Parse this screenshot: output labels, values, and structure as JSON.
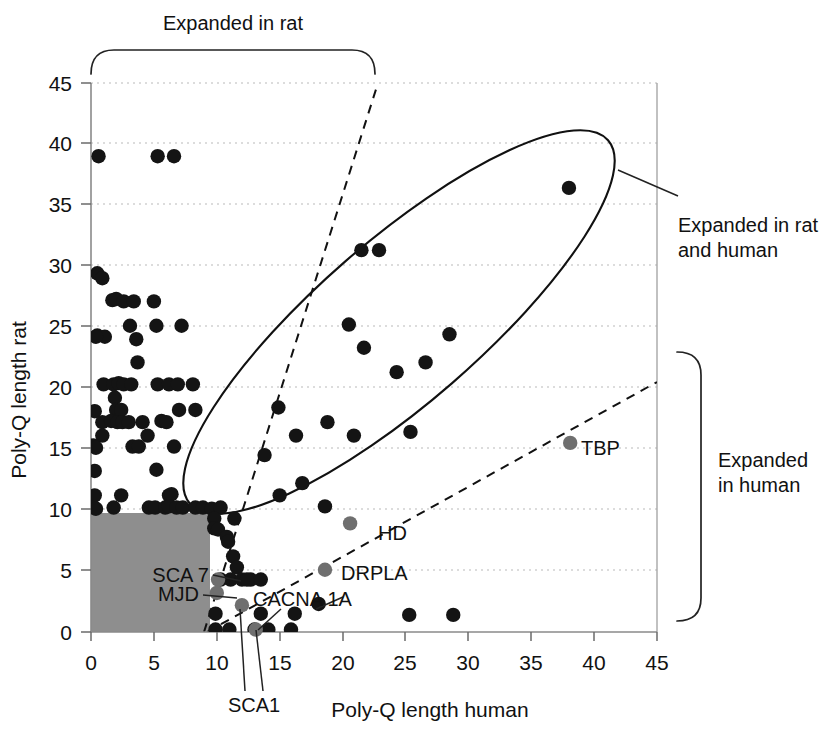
{
  "figure": {
    "background_color": "#ffffff",
    "point_color": "#141414",
    "gene_point_color": "#6f6f6f",
    "shade_color": "#8e8e8e"
  },
  "annotations": {
    "top_bracket_label": "Expanded in rat",
    "right_bracket_label_line1": "Expanded",
    "right_bracket_label_line2": "in human",
    "ellipse_label_line1": "Expanded in rat",
    "ellipse_label_line2": "and human"
  },
  "chart_data": {
    "type": "scatter",
    "title": "",
    "xlabel": "Poly-Q length human",
    "ylabel": "Poly-Q length rat",
    "xlim": [
      0,
      45
    ],
    "ylim": [
      0,
      45
    ],
    "xticks": [
      0,
      5,
      10,
      15,
      20,
      25,
      30,
      35,
      40,
      45
    ],
    "yticks": [
      0,
      5,
      10,
      15,
      20,
      25,
      30,
      35,
      40,
      45
    ],
    "xtick_labels": [
      "0",
      "5",
      "10",
      "15",
      "20",
      "25",
      "30",
      "35",
      "40",
      "45"
    ],
    "ytick_labels": [
      "0",
      "5",
      "10",
      "15",
      "20",
      "25",
      "30",
      "35",
      "40",
      "45"
    ],
    "grid": true,
    "grid_axis": "y",
    "legend": "none",
    "series": [
      {
        "name": "Poly-Q repeat pairs",
        "marker": "filled-circle",
        "color": "#141414",
        "points": [
          [
            0.6,
            39.0
          ],
          [
            5.3,
            39.0
          ],
          [
            6.6,
            39.0
          ],
          [
            0.5,
            29.4
          ],
          [
            0.9,
            29.0
          ],
          [
            1.7,
            27.2
          ],
          [
            2.0,
            27.3
          ],
          [
            2.6,
            27.1
          ],
          [
            3.4,
            27.1
          ],
          [
            5.0,
            27.1
          ],
          [
            0.5,
            24.3
          ],
          [
            1.1,
            24.2
          ],
          [
            3.1,
            25.1
          ],
          [
            5.2,
            25.1
          ],
          [
            7.2,
            25.1
          ],
          [
            3.6,
            24.0
          ],
          [
            3.7,
            22.1
          ],
          [
            0.4,
            24.2
          ],
          [
            1.0,
            20.3
          ],
          [
            1.8,
            20.3
          ],
          [
            2.2,
            20.4
          ],
          [
            2.6,
            20.3
          ],
          [
            3.2,
            20.3
          ],
          [
            5.3,
            20.3
          ],
          [
            6.2,
            20.3
          ],
          [
            6.9,
            20.3
          ],
          [
            8.1,
            20.3
          ],
          [
            1.9,
            19.2
          ],
          [
            0.3,
            18.1
          ],
          [
            2.0,
            18.2
          ],
          [
            2.4,
            18.2
          ],
          [
            7.0,
            18.2
          ],
          [
            8.3,
            18.2
          ],
          [
            0.9,
            17.2
          ],
          [
            1.6,
            17.3
          ],
          [
            2.1,
            17.2
          ],
          [
            2.5,
            17.2
          ],
          [
            3.0,
            17.2
          ],
          [
            4.1,
            17.2
          ],
          [
            5.6,
            17.3
          ],
          [
            6.0,
            17.2
          ],
          [
            0.9,
            16.1
          ],
          [
            4.5,
            16.1
          ],
          [
            0.2,
            15.3
          ],
          [
            0.4,
            15.1
          ],
          [
            3.3,
            15.2
          ],
          [
            3.8,
            15.2
          ],
          [
            6.6,
            15.2
          ],
          [
            0.3,
            13.2
          ],
          [
            5.2,
            13.3
          ],
          [
            0.3,
            11.2
          ],
          [
            2.4,
            11.2
          ],
          [
            6.2,
            11.2
          ],
          [
            6.4,
            11.3
          ],
          [
            0.2,
            10.2
          ],
          [
            0.4,
            10.1
          ],
          [
            1.8,
            10.2
          ],
          [
            4.6,
            10.2
          ],
          [
            5.1,
            10.2
          ],
          [
            5.9,
            10.2
          ],
          [
            6.2,
            10.3
          ],
          [
            6.8,
            10.2
          ],
          [
            7.3,
            10.2
          ],
          [
            8.3,
            10.2
          ],
          [
            8.9,
            10.2
          ],
          [
            9.6,
            10.1
          ],
          [
            10.3,
            10.2
          ],
          [
            9.8,
            9.3
          ],
          [
            11.4,
            9.3
          ],
          [
            9.8,
            8.5
          ],
          [
            10.1,
            8.4
          ],
          [
            10.8,
            7.8
          ],
          [
            10.9,
            7.4
          ],
          [
            11.3,
            6.2
          ],
          [
            11.6,
            5.3
          ],
          [
            10.3,
            4.3
          ],
          [
            11.1,
            4.3
          ],
          [
            12.7,
            4.3
          ],
          [
            13.5,
            4.3
          ],
          [
            9.9,
            1.5
          ],
          [
            9.9,
            0.2
          ],
          [
            11.0,
            0.2
          ],
          [
            13.0,
            0.2
          ],
          [
            14.1,
            0.2
          ],
          [
            15.9,
            0.2
          ],
          [
            13.5,
            1.5
          ],
          [
            16.2,
            1.5
          ],
          [
            18.1,
            2.3
          ],
          [
            13.8,
            14.5
          ],
          [
            14.9,
            18.4
          ],
          [
            16.3,
            16.1
          ],
          [
            15.0,
            11.2
          ],
          [
            16.8,
            12.2
          ],
          [
            18.8,
            17.2
          ],
          [
            18.6,
            10.3
          ],
          [
            20.9,
            16.1
          ],
          [
            20.5,
            25.2
          ],
          [
            21.5,
            31.3
          ],
          [
            21.7,
            23.3
          ],
          [
            22.9,
            31.3
          ],
          [
            24.3,
            21.3
          ],
          [
            25.3,
            1.4
          ],
          [
            25.4,
            16.4
          ],
          [
            26.6,
            22.1
          ],
          [
            28.5,
            24.4
          ],
          [
            28.8,
            1.4
          ],
          [
            38.0,
            36.4
          ],
          [
            12.0,
            4.3
          ],
          [
            12.4,
            4.3
          ]
        ]
      },
      {
        "name": "Disease genes",
        "marker": "filled-circle",
        "color": "#6f6f6f",
        "points": [
          {
            "label": "SCA 7",
            "x": 10.1,
            "y": 4.3
          },
          {
            "label": "MJD",
            "x": 10.0,
            "y": 3.2
          },
          {
            "label": "SCA1",
            "x": 12.0,
            "y": 2.2
          },
          {
            "label": "CACNA 1A",
            "x": 13.1,
            "y": 0.2
          },
          {
            "label": "HD",
            "x": 20.6,
            "y": 8.9
          },
          {
            "label": "DRPLA",
            "x": 18.6,
            "y": 5.1
          },
          {
            "label": "TBP",
            "x": 38.1,
            "y": 15.5
          }
        ]
      }
    ],
    "shaded_region": {
      "label": "normal range",
      "x0": 0,
      "x1": 9.5,
      "y0": 0,
      "y1": 9.5
    },
    "reference_lines": [
      {
        "name": "upper-dashed",
        "style": "dashed",
        "x0": 9.0,
        "y0": 0.0,
        "x1": 22.8,
        "y1": 45.0
      },
      {
        "name": "lower-dashed",
        "style": "dashed",
        "x0": 9.2,
        "y0": 0.0,
        "x1": 45.0,
        "y1": 20.5
      }
    ],
    "ellipse": {
      "name": "expanded-in-rat-and-human-region",
      "center_x": 24.5,
      "center_y": 25.5,
      "semi_major": 22.0,
      "semi_minor": 6.6,
      "rotation_deg": -41
    }
  }
}
